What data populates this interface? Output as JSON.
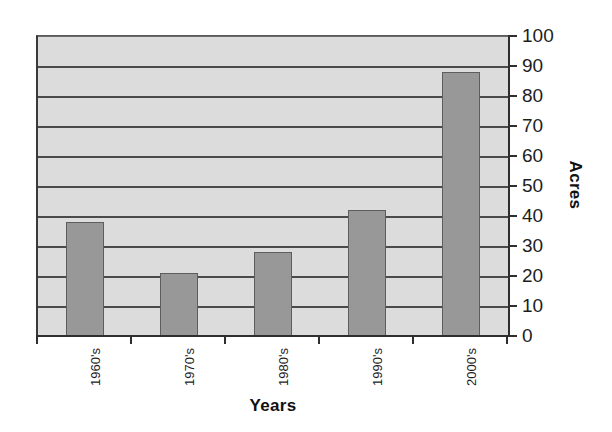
{
  "chart_data": {
    "type": "bar",
    "title": "",
    "subtitle": "",
    "xlabel": "Years",
    "ylabel": "Acres",
    "categories": [
      "1960's",
      "1970's",
      "1980's",
      "1990's",
      "2000's"
    ],
    "values": [
      38,
      21,
      28,
      42,
      88
    ],
    "ylim": [
      0,
      100
    ],
    "ytick_labels": [
      "0",
      "10",
      "20",
      "30",
      "40",
      "50",
      "60",
      "70",
      "80",
      "90",
      "100"
    ],
    "ytick_values": [
      0,
      10,
      20,
      30,
      40,
      50,
      60,
      70,
      80,
      90,
      100
    ],
    "grid": true,
    "grid_axis": "y",
    "legend": false,
    "legend_position": "none",
    "bar_color": "#989898",
    "bar_edge_color": "#5d5d5d",
    "plot_background": "#dcdcdc",
    "gridline_color": "#4a4a4a",
    "axis_color": "#2e2e2e",
    "text_color": "#1d1d1d",
    "value_axis_side": "right",
    "category_label_rotation": 90
  },
  "axes": {
    "x_title": "Years",
    "y_title": "Acres"
  }
}
